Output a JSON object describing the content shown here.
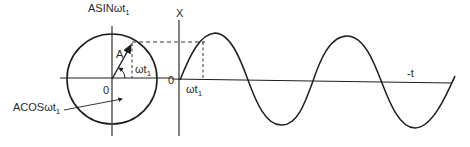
{
  "diagram": {
    "colors": {
      "ink": "#1e1e1e",
      "background": "#ffffff"
    },
    "phasor": {
      "vertical_axis_label": "ASINωt",
      "vertical_axis_label_sub": "1",
      "origin_label": "0",
      "vector_label": "A",
      "angle_label": "ωt",
      "angle_label_sub": "1",
      "projection_label": "ACOSωt",
      "projection_label_sub": "1",
      "center": [
        112,
        79
      ],
      "radius": 45,
      "angle_deg": 57
    },
    "waveform": {
      "y_axis_label": "X",
      "origin_label": "0",
      "time_marker_label": "ωt",
      "time_marker_label_sub": "1",
      "x_axis_label": "-t",
      "start_x": 180,
      "end_x": 455,
      "period_px": 133,
      "amplitude_px": 46,
      "baseline_y_start": 79,
      "baseline_y_end": 83
    }
  }
}
